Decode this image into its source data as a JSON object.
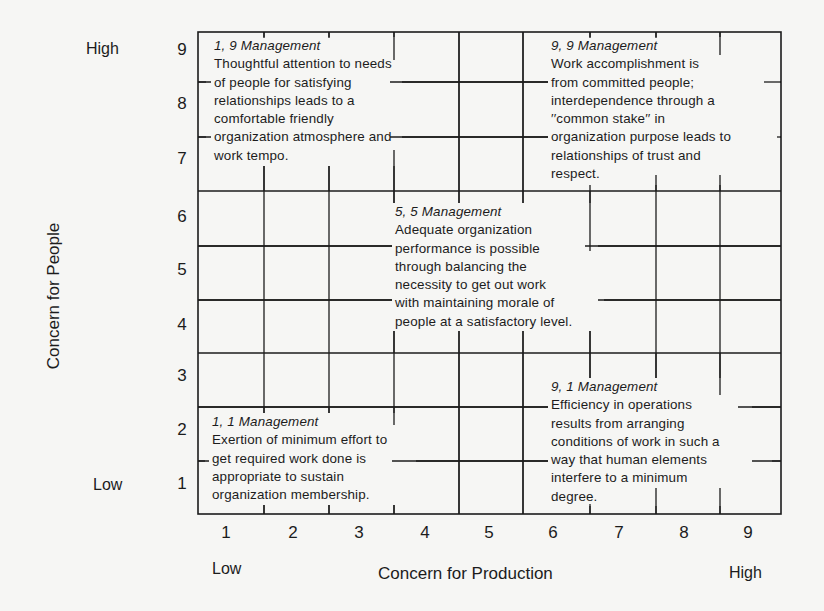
{
  "diagram": {
    "type": "managerial-grid",
    "y_axis": {
      "label": "Concern for People",
      "low_label": "Low",
      "high_label": "High",
      "ticks": [
        "9",
        "8",
        "7",
        "6",
        "5",
        "4",
        "3",
        "2",
        "1"
      ]
    },
    "x_axis": {
      "label": "Concern for Production",
      "low_label": "Low",
      "high_label": "High",
      "ticks": [
        "1",
        "2",
        "3",
        "4",
        "5",
        "6",
        "7",
        "8",
        "9"
      ]
    },
    "styles": [
      {
        "id": "1-9",
        "title": "1, 9 Management",
        "lines": [
          "Thoughtful attention to needs",
          "of people for satisfying",
          "relationships leads to a",
          "comfortable friendly",
          "organization atmosphere and",
          "work tempo."
        ]
      },
      {
        "id": "9-9",
        "title": "9, 9 Management",
        "lines": [
          "Work accomplishment is",
          "from committed people;",
          "interdependence through a",
          "′′common stake′′ in",
          "organization purpose leads to",
          "relationships of trust and",
          "respect."
        ]
      },
      {
        "id": "5-5",
        "title": "5, 5 Management",
        "lines": [
          "Adequate organization",
          "performance is possible",
          "through balancing the",
          "necessity to get out work",
          "with maintaining morale of",
          "people at a satisfactory level."
        ]
      },
      {
        "id": "1-1",
        "title": "1, 1 Management",
        "lines": [
          "Exertion of minimum effort to",
          "get required work done is",
          "appropriate to sustain",
          "organization membership."
        ]
      },
      {
        "id": "9-1",
        "title": "9, 1 Management",
        "lines": [
          "Efficiency in operations",
          "results from arranging",
          "conditions of work in such a",
          "way that human elements",
          "interfere to a minimum",
          "degree."
        ]
      }
    ],
    "colors": {
      "background": "#f6f6f4",
      "ink": "#1c1c1c"
    }
  }
}
